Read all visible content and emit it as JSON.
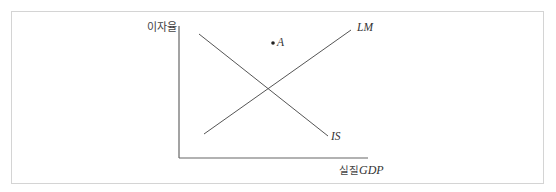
{
  "diagram": {
    "type": "IS-LM model",
    "y_axis_label": "이자율",
    "x_axis_label_ko": "실질",
    "x_axis_label_en": "GDP",
    "curves": [
      {
        "name": "IS",
        "label": "IS",
        "slope": "downward",
        "from": [
          199,
          34
        ],
        "to": [
          328,
          136
        ]
      },
      {
        "name": "LM",
        "label": "LM",
        "slope": "upward",
        "from": [
          204,
          134
        ],
        "to": [
          351,
          30
        ]
      }
    ],
    "points": [
      {
        "name": "A",
        "label": "A",
        "position": "above IS and LM, left of LM",
        "x": 273,
        "y": 43
      }
    ],
    "equilibrium": {
      "x": 269,
      "y": 88
    },
    "colors": {
      "line": "#555555",
      "axis": "#666666",
      "frame": "#d4d4d4"
    }
  }
}
